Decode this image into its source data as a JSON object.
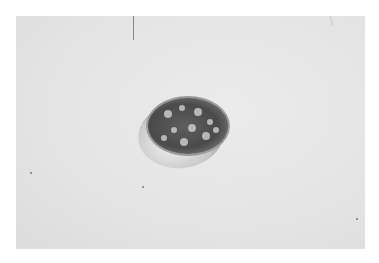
{
  "image": {
    "subject": "petri dish with colonies",
    "background_color": "#e6e6e6",
    "border_color": "#ffffff"
  },
  "colonies": [
    {
      "x": 20,
      "y": 16,
      "r": 4
    },
    {
      "x": 34,
      "y": 10,
      "r": 3
    },
    {
      "x": 50,
      "y": 14,
      "r": 4
    },
    {
      "x": 62,
      "y": 24,
      "r": 3
    },
    {
      "x": 26,
      "y": 32,
      "r": 3
    },
    {
      "x": 44,
      "y": 30,
      "r": 4
    },
    {
      "x": 58,
      "y": 38,
      "r": 4
    },
    {
      "x": 16,
      "y": 40,
      "r": 3
    },
    {
      "x": 36,
      "y": 44,
      "r": 4
    },
    {
      "x": 68,
      "y": 32,
      "r": 3
    }
  ]
}
